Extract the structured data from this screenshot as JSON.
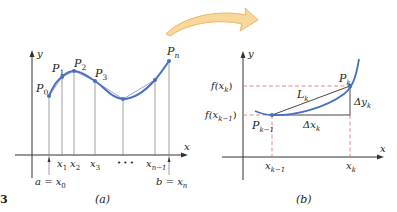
{
  "figure": {
    "number_fragment": "3",
    "colors": {
      "curve": "#4a6fc0",
      "polygon": "#8a9cc9",
      "point": "#4a6fc0",
      "axis": "#333333",
      "dashed": "#e06a6a",
      "arrow_fill": "#f7d89a",
      "arrow_stroke": "#e9b86a"
    }
  },
  "panel_a": {
    "caption": "(a)",
    "axis_y_label": "y",
    "axis_x_label": "x",
    "points": [
      {
        "label": "P",
        "sub": "0"
      },
      {
        "label": "P",
        "sub": "1"
      },
      {
        "label": "P",
        "sub": "2"
      },
      {
        "label": "P",
        "sub": "3"
      },
      {
        "label": "P",
        "sub": "n"
      }
    ],
    "x_ticks": [
      {
        "label": "x",
        "sub": "1"
      },
      {
        "label": "x",
        "sub": "2"
      },
      {
        "label": "x",
        "sub": "3"
      },
      {
        "label": "x",
        "sub": "n−1"
      }
    ],
    "ellipsis": "• • •",
    "left_bound": {
      "lhs": "a = x",
      "sub": "0"
    },
    "right_bound": {
      "lhs": "b = x",
      "sub": "n"
    }
  },
  "panel_b": {
    "caption": "(b)",
    "axis_y_label": "y",
    "axis_x_label": "x",
    "y_ticks": [
      {
        "label": "f(x",
        "sub": "k",
        "close": ")"
      },
      {
        "label": "f(x",
        "sub": "k−1",
        "close": ")"
      }
    ],
    "x_ticks": [
      {
        "label": "x",
        "sub": "k−1"
      },
      {
        "label": "x",
        "sub": "k"
      }
    ],
    "point_start": {
      "label": "P",
      "sub": "k−1"
    },
    "point_end": {
      "label": "P",
      "sub": "k"
    },
    "segment": {
      "label": "L",
      "sub": "k"
    },
    "delta_x": {
      "label": "Δx",
      "sub": "k"
    },
    "delta_y": {
      "label": "Δy",
      "sub": "k"
    }
  }
}
